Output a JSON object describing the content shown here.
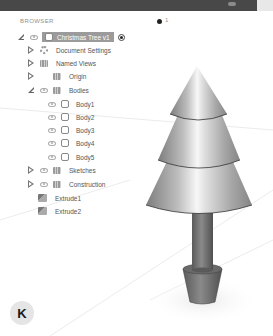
{
  "browser": {
    "title": "BROWSER",
    "count": "1",
    "root": {
      "label": "Christmas Tree v1",
      "expanded": true
    },
    "items": [
      {
        "label": "Document Settings",
        "icon": "gear-icon",
        "expander": "collapsed",
        "visible_toggle": false
      },
      {
        "label": "Named Views",
        "icon": "folder-icon",
        "expander": "collapsed",
        "visible_toggle": false
      },
      {
        "label": "Origin",
        "icon": "folder-icon",
        "expander": "collapsed",
        "visible_toggle": false
      },
      {
        "label": "Bodies",
        "icon": "folder-icon",
        "expander": "expanded",
        "visible_toggle": true
      }
    ],
    "bodies": [
      {
        "label": "Body1"
      },
      {
        "label": "Body2"
      },
      {
        "label": "Body3"
      },
      {
        "label": "Body4"
      },
      {
        "label": "Body5"
      }
    ],
    "after": [
      {
        "label": "Sketches",
        "icon": "folder-icon",
        "expander": "collapsed"
      },
      {
        "label": "Construction",
        "icon": "folder-icon",
        "expander": "collapsed"
      }
    ],
    "features": [
      {
        "label": "Extrude1",
        "icon": "extrude-icon"
      },
      {
        "label": "Extrude2",
        "icon": "extrude-icon"
      }
    ]
  },
  "badge": {
    "letter": "K"
  },
  "colors": {
    "topbar": "#484848",
    "selected_bg": "#9b9b9b",
    "metal_light": "#f2f2f2",
    "metal_dark": "#8a8a8a",
    "trunk": "#6e6e6e"
  }
}
